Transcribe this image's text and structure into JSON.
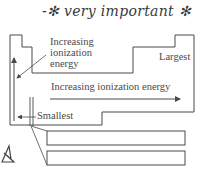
{
  "annotation": {
    "handwritten_note": "-✻ very important ✻"
  },
  "diagram": {
    "type": "periodic-table-trend",
    "group_trend_label": "Increasing\nionization\nenergy",
    "group_trend_lines": [
      "Increasing",
      "ionization",
      "energy"
    ],
    "period_trend_label": "Increasing ionization energy",
    "max_label": "Largest",
    "min_label": "Smallest",
    "colors": {
      "stroke": "#4a4a4a",
      "text": "#4a4a4a",
      "background": "#ffffff"
    }
  }
}
